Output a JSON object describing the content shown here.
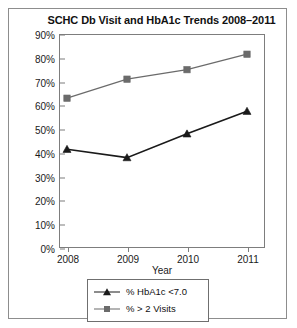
{
  "figure": {
    "border_color": "#8d8d8d"
  },
  "chart_data": {
    "type": "line",
    "title": "SCHC Db Visit and HbA1c Trends 2008–2011",
    "xlabel": "Year",
    "ylabel": "",
    "categories": [
      "2008",
      "2009",
      "2010",
      "2011"
    ],
    "x": [
      2008,
      2009,
      2010,
      2011
    ],
    "ylim": [
      0,
      90
    ],
    "yticks": [
      0,
      10,
      20,
      30,
      40,
      50,
      60,
      70,
      80,
      90
    ],
    "ytick_labels": [
      "0%",
      "10%",
      "20%",
      "30%",
      "40%",
      "50%",
      "60%",
      "70%",
      "80%",
      "90%"
    ],
    "grid": false,
    "legend_position": "below-axes",
    "series": [
      {
        "name": "% HbA1c <7.0",
        "marker": "triangle",
        "color": "#1a1a1a",
        "values": [
          41.5,
          38,
          48,
          57.5
        ]
      },
      {
        "name": "% > 2 Visits",
        "marker": "square",
        "color": "#6b6b6b",
        "values": [
          63,
          71,
          75,
          81.5
        ]
      }
    ]
  },
  "legend": {
    "items": [
      {
        "label": "% HbA1c <7.0",
        "marker": "triangle-marker",
        "color": "#1a1a1a"
      },
      {
        "label": "% > 2 Visits",
        "marker": "square-marker",
        "color": "#6b6b6b"
      }
    ]
  }
}
